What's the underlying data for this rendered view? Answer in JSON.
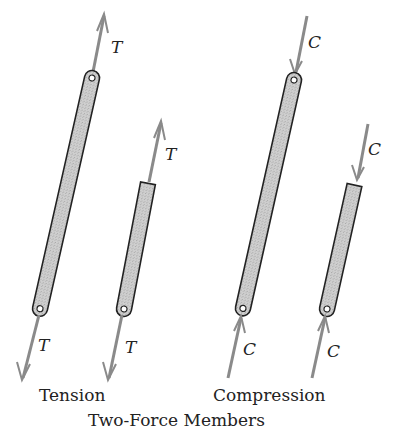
{
  "title": "Two-Force Members",
  "groups": {
    "tension": {
      "label": "Tension",
      "force_symbol": "T"
    },
    "compression": {
      "label": "Compression",
      "force_symbol": "C"
    }
  },
  "members": [
    {
      "name": "long-tension-member",
      "group": "tension",
      "ends": [
        "pin",
        "pin"
      ],
      "top_label": "T",
      "bottom_label": "T"
    },
    {
      "name": "short-tension-member",
      "group": "tension",
      "ends": [
        "square",
        "pin"
      ],
      "top_label": "T",
      "bottom_label": "T"
    },
    {
      "name": "long-compression-member",
      "group": "compression",
      "ends": [
        "pin",
        "pin"
      ],
      "top_label": "C",
      "bottom_label": "C"
    },
    {
      "name": "short-compression-member",
      "group": "compression",
      "ends": [
        "square",
        "pin"
      ],
      "top_label": "C",
      "bottom_label": "C"
    }
  ],
  "colors": {
    "arrow": "#8a8a8a",
    "member_fill": "#c9c9c9",
    "member_outline": "#222222",
    "text": "#222222"
  }
}
